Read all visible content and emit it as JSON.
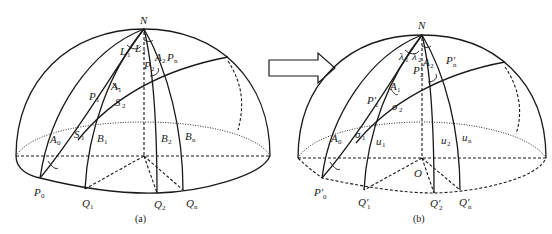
{
  "figure": {
    "panel_a": {
      "caption": "(a)",
      "labels": {
        "pole": "N",
        "L1": "L",
        "L1_sub": "1",
        "L2": "L",
        "L2_sub": "2",
        "A0": "A",
        "A0_sub": "0",
        "A1": "A",
        "A1_sub": "1",
        "A2": "A",
        "A2_sub": "2",
        "P0": "P",
        "P0_sub": "0",
        "P1": "P",
        "P1_sub": "1",
        "P2": "P",
        "P2_sub": "2",
        "Pn": "P",
        "Pn_sub": "n",
        "S1": "S",
        "S1_sub": "1",
        "S2": "S",
        "S2_sub": "2",
        "B1": "B",
        "B1_sub": "1",
        "B2": "B",
        "B2_sub": "2",
        "Bn": "B",
        "Bn_sub": "n",
        "Q1": "Q",
        "Q1_sub": "1",
        "Q2": "Q",
        "Q2_sub": "2",
        "Qn": "Q",
        "Qn_sub": "n"
      }
    },
    "panel_b": {
      "caption": "(b)",
      "labels": {
        "pole": "N",
        "origin": "O",
        "lambda1": "λ",
        "lambda1_sub": "1",
        "lambda2": "λ",
        "lambda2_sub": "2",
        "A0": "A",
        "A0_sub": "0",
        "A1": "A",
        "A1_sub": "1",
        "A2": "A",
        "A2_sub": "2",
        "P0": "P′",
        "P0_sub": "0",
        "P1": "P′",
        "P1_sub": "1",
        "P2": "P′",
        "P2_sub": "2",
        "Pn": "P′",
        "Pn_sub": "n",
        "sigma1": "σ",
        "sigma1_sub": "1",
        "sigma2": "σ",
        "sigma2_sub": "2",
        "u1": "u",
        "u1_sub": "1",
        "u2": "u",
        "u2_sub": "2",
        "un": "u",
        "un_sub": "n",
        "Q1": "Q′",
        "Q1_sub": "1",
        "Q2": "Q′",
        "Q2_sub": "2",
        "Qn": "Q′",
        "Qn_sub": "n"
      }
    },
    "arrow": {
      "direction": "right",
      "style": "hollow"
    }
  }
}
